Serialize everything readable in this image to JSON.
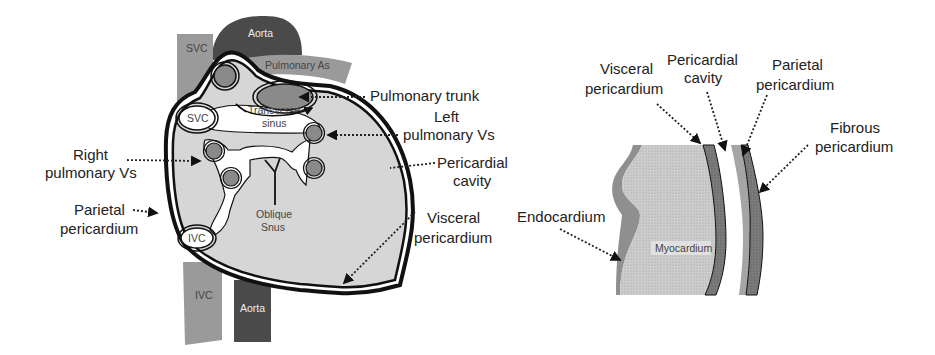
{
  "colors": {
    "background": "#ffffff",
    "heart_fill": "#d6d6d6",
    "vessel_light": "#9a9a9a",
    "vessel_dark": "#4a4a4a",
    "vein_fill": "#8a8a8a",
    "outline": "#111111",
    "myocardium": "#c8c8c8",
    "endocardium": "#8f8f8f",
    "visceral_layer": "#7a7a7a",
    "parietal_layer": "#a5a5a5",
    "fibrous_layer": "#6a6a6a",
    "label_text": "#222222"
  },
  "left_figure": {
    "vessels": {
      "svc_top": "SVC",
      "aorta_top": "Aorta",
      "pulmonary_as": "Pulmonary As",
      "ivc_bottom": "IVC",
      "aorta_bottom": "Aorta"
    },
    "inner_labels": {
      "svc": "SVC",
      "ivc": "IVC",
      "transverse_line1": "Transverse",
      "transverse_line2": "sinus",
      "oblique_line1": "Oblique",
      "oblique_line2": "Snus"
    },
    "callouts": {
      "pulmonary_trunk": "Pulmonary trunk",
      "left_pv_line1": "Left",
      "left_pv_line2": "pulmonary Vs",
      "pericardial_cavity_line1": "Pericardial",
      "pericardial_cavity_line2": "cavity",
      "visceral_line1": "Visceral",
      "visceral_line2": "pericardium",
      "right_pv_line1": "Right",
      "right_pv_line2": "pulmonary Vs",
      "parietal_line1": "Parietal",
      "parietal_line2": "pericardium"
    }
  },
  "right_figure": {
    "inner_labels": {
      "myocardium": "Myocardium"
    },
    "callouts": {
      "visceral_line1": "Visceral",
      "visceral_line2": "pericardium",
      "cavity_line1": "Pericardial",
      "cavity_line2": "cavity",
      "parietal_line1": "Parietal",
      "parietal_line2": "pericardium",
      "fibrous_line1": "Fibrous",
      "fibrous_line2": "pericardium",
      "endocardium": "Endocardium"
    }
  }
}
